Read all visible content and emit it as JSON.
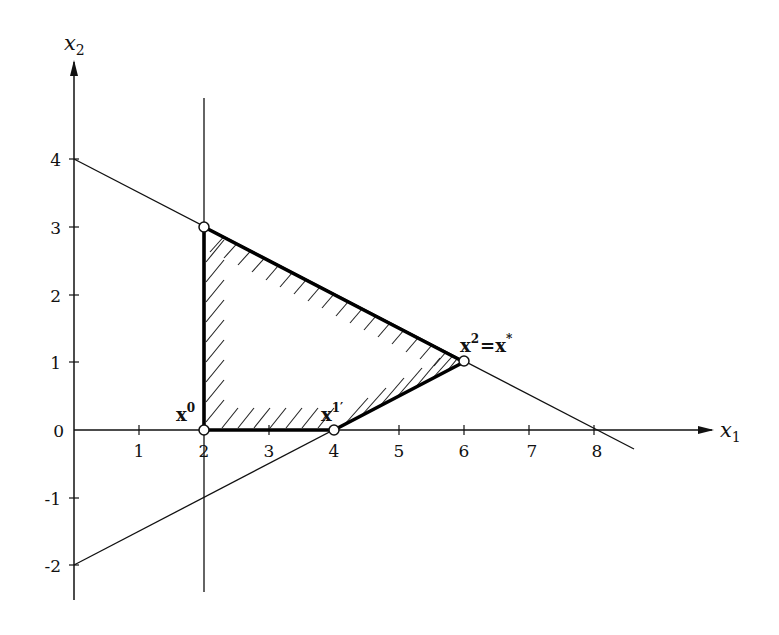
{
  "diagram": {
    "type": "linear-programming-feasible-region",
    "axes": {
      "x_label": "x",
      "x_sub": "1",
      "y_label": "x",
      "y_sub": "2",
      "x_ticks": [
        "1",
        "2",
        "3",
        "4",
        "5",
        "6",
        "7",
        "8"
      ],
      "y_ticks": [
        "4",
        "3",
        "2",
        "1",
        "0",
        "-1",
        "-2"
      ]
    },
    "constraint_lines": [
      {
        "name": "x1 + 2x2 = 8",
        "from": [
          0,
          4
        ],
        "to": [
          8.6,
          -0.3
        ]
      },
      {
        "name": "x1 - 2x2 = 4",
        "from": [
          0,
          -2
        ],
        "to": [
          6,
          1
        ]
      },
      {
        "name": "x1 = 2",
        "from": [
          2,
          4.9
        ],
        "to": [
          2,
          -2.4
        ]
      }
    ],
    "feasible_region": [
      [
        2,
        0
      ],
      [
        4,
        0
      ],
      [
        6,
        1
      ],
      [
        2,
        3
      ]
    ],
    "points": [
      {
        "label": "x",
        "sup": "0",
        "coords": [
          2,
          0
        ]
      },
      {
        "label": "x",
        "sup": "1′",
        "coords": [
          4,
          0
        ]
      },
      {
        "label": "x",
        "sup": "2",
        "suffix": "= x*",
        "coords": [
          6,
          1
        ]
      },
      {
        "label": "",
        "sup": "",
        "coords": [
          2,
          3
        ]
      }
    ],
    "labels": {
      "p0_main": "x",
      "p0_sup": "0",
      "p1_main": "x",
      "p1_sup": "1′",
      "p2_main": "x",
      "p2_sup": "2",
      "p2_eq": "=",
      "p2_opt": "x",
      "p2_star": "*"
    },
    "colors": {
      "line": "#111111",
      "background": "#ffffff",
      "point_fill": "#ffffff"
    }
  }
}
